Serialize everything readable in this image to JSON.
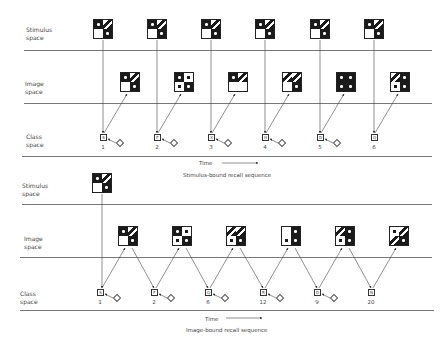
{
  "top": {
    "labels": {
      "stimulus": "Stimulus\nspace",
      "image": "Image\nspace",
      "class": "Class\nspace"
    },
    "time_label": "Time",
    "caption": "Stimulus-bound recall sequence",
    "steps": [
      {
        "class_symbol": "S",
        "number": "1"
      },
      {
        "class_symbol": "F",
        "number": "2"
      },
      {
        "class_symbol": "X",
        "number": "3"
      },
      {
        "class_symbol": "H",
        "number": "4"
      },
      {
        "class_symbol": "D",
        "number": "5"
      },
      {
        "class_symbol": "Q",
        "number": "6"
      }
    ]
  },
  "bottom": {
    "labels": {
      "stimulus": "Stimulus\nspace",
      "image": "Image\nspace",
      "class": "Class\nspace"
    },
    "time_label": "Time",
    "caption": "Image-bound recall sequence",
    "steps": [
      {
        "class_symbol": "S",
        "number": "1"
      },
      {
        "class_symbol": "F",
        "number": "2"
      },
      {
        "class_symbol": "Q",
        "number": "6"
      },
      {
        "class_symbol": "R",
        "number": "12"
      },
      {
        "class_symbol": "D",
        "number": "9"
      },
      {
        "class_symbol": "N",
        "number": "20"
      }
    ]
  }
}
